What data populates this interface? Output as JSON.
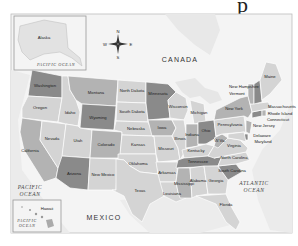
{
  "title_fragment": "p",
  "compass": {
    "n": "N",
    "s": "S",
    "e": "E",
    "w": "W"
  },
  "countries": {
    "canada": "CANADA",
    "mexico": "MEXICO"
  },
  "oceans": {
    "pacific_main": [
      "PACIFIC",
      "OCEAN"
    ],
    "atlantic": [
      "ATLANTIC",
      "OCEAN"
    ],
    "pacific_alaska": "PACIFIC OCEAN",
    "pacific_hawaii": [
      "PACIFIC",
      "OCEAN"
    ]
  },
  "insets": {
    "alaska": "Alaska",
    "hawaii": "Hawaii"
  },
  "colors": {
    "dark": "#8a8a8a",
    "medium": "#b3b3b3",
    "light": "#d4d4d4",
    "water": "#ebebeb",
    "land_foreign": "#f4f4f4"
  },
  "states": {
    "washington": "Washington",
    "oregon": "Oregon",
    "california": "California",
    "nevada": "Nevada",
    "idaho": "Idaho",
    "montana": "Montana",
    "wyoming": "Wyoming",
    "utah": "Utah",
    "arizona": "Arizona",
    "colorado": "Colorado",
    "new_mexico": "New Mexico",
    "north_dakota": "North Dakota",
    "south_dakota": "South Dakota",
    "nebraska": "Nebraska",
    "kansas": "Kansas",
    "oklahoma": "Oklahoma",
    "texas": "Texas",
    "minnesota": "Minnesota",
    "iowa": "Iowa",
    "missouri": "Missouri",
    "arkansas": "Arkansas",
    "louisiana": "Louisiana",
    "wisconsin": "Wisconsin",
    "illinois": "Illinois",
    "michigan": "Michigan",
    "indiana": "Indiana",
    "ohio": "Ohio",
    "kentucky": "Kentucky",
    "tennessee": "Tennessee",
    "mississippi": "Mississippi",
    "alabama": "Alabama",
    "georgia": "Georgia",
    "florida": "Florida",
    "south_carolina": "South Carolina",
    "north_carolina": "North Carolina",
    "virginia": "Virginia",
    "west_virginia": "W.Va.",
    "pennsylvania": "Pennsylvania",
    "new_york": "New York",
    "new_jersey": "New Jersey",
    "delaware": "Delaware",
    "maryland": "Maryland",
    "connecticut": "Connecticut",
    "rhode_island": "Rhode Island",
    "massachusetts": "Massachusetts",
    "vermont": "Vermont",
    "new_hampshire": "New Hampshire",
    "maine": "Maine"
  }
}
